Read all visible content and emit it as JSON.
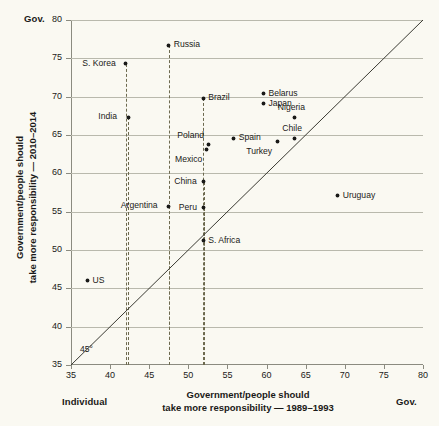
{
  "chart_data": {
    "type": "scatter",
    "title": "",
    "xlabel": "Government/people should take more responsibility — 1989–1993",
    "ylabel": "Government/people should take more responsibility — 2010–2014",
    "xlim": [
      35,
      80
    ],
    "ylim": [
      35,
      80
    ],
    "xticks": [
      35,
      40,
      45,
      50,
      55,
      60,
      65,
      70,
      75,
      80
    ],
    "yticks": [
      35,
      40,
      45,
      50,
      55,
      60,
      65,
      70,
      75,
      80
    ],
    "grid": "horizontal",
    "legend": "none",
    "reference_line": {
      "label": "45°",
      "type": "identity",
      "from": [
        35,
        35
      ],
      "to": [
        80,
        80
      ]
    },
    "axis_end_captions": {
      "x_low": "Individual",
      "x_high": "Gov.",
      "y_high": "Gov."
    },
    "points": [
      {
        "name": "S. Korea",
        "x": 42.0,
        "y": 74.3,
        "label_pos": "left",
        "dropline": true
      },
      {
        "name": "Russia",
        "x": 47.5,
        "y": 76.7,
        "label_pos": "right",
        "dropline": true
      },
      {
        "name": "India",
        "x": 42.3,
        "y": 67.3,
        "label_pos": "left",
        "dropline": true
      },
      {
        "name": "Brazil",
        "x": 51.9,
        "y": 69.8,
        "label_pos": "right",
        "dropline": true
      },
      {
        "name": "Belarus",
        "x": 59.6,
        "y": 70.4,
        "label_pos": "right",
        "dropline": false
      },
      {
        "name": "Japan",
        "x": 59.6,
        "y": 69.1,
        "label_pos": "right",
        "dropline": false
      },
      {
        "name": "Nigeria",
        "x": 63.6,
        "y": 67.3,
        "label_pos": "above",
        "dropline": false
      },
      {
        "name": "Poland",
        "x": 52.6,
        "y": 63.8,
        "label_pos": "above-left",
        "dropline": false
      },
      {
        "name": "Mexico",
        "x": 52.3,
        "y": 63.1,
        "label_pos": "below-left",
        "dropline": false
      },
      {
        "name": "Spain",
        "x": 55.8,
        "y": 64.6,
        "label_pos": "right",
        "dropline": false
      },
      {
        "name": "Chile",
        "x": 63.6,
        "y": 64.6,
        "label_pos": "above",
        "dropline": false
      },
      {
        "name": "Turkey",
        "x": 61.4,
        "y": 64.1,
        "label_pos": "below-left",
        "dropline": false
      },
      {
        "name": "China",
        "x": 52.0,
        "y": 58.9,
        "label_pos": "left",
        "dropline": true
      },
      {
        "name": "Argentina",
        "x": 47.5,
        "y": 55.7,
        "label_pos": "left",
        "dropline": true
      },
      {
        "name": "Peru",
        "x": 52.0,
        "y": 55.5,
        "label_pos": "left",
        "dropline": true
      },
      {
        "name": "Uruguay",
        "x": 69.1,
        "y": 57.1,
        "label_pos": "right",
        "dropline": false
      },
      {
        "name": "S. Africa",
        "x": 51.9,
        "y": 51.2,
        "label_pos": "right",
        "dropline": false
      },
      {
        "name": "US",
        "x": 37.1,
        "y": 46.0,
        "label_pos": "right",
        "dropline": false
      }
    ]
  },
  "colors": {
    "background": "#faf9f2",
    "point": "#1a1a18",
    "gridline": "#b9b9ad",
    "axis": "#8b8b80",
    "dropline": "#6d6a4f",
    "text": "#1a1a18"
  }
}
